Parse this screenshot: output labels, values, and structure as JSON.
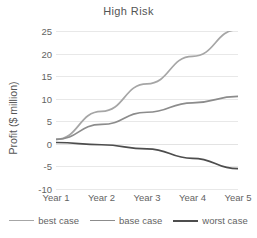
{
  "chart_data": {
    "type": "line",
    "title": "High Risk",
    "xlabel": "",
    "ylabel": "Profit ($ million)",
    "categories": [
      "Year 1",
      "Year 2",
      "Year 3",
      "Year 4",
      "Year 5"
    ],
    "ylim": [
      -10,
      25
    ],
    "yticks": [
      25,
      20,
      15,
      10,
      5,
      0,
      -5,
      -10
    ],
    "grid": true,
    "legend_position": "bottom",
    "series": [
      {
        "name": "best case",
        "color": "#a6a6a6",
        "values": [
          1.0,
          7.2,
          13.3,
          19.4,
          25.3
        ]
      },
      {
        "name": "base case",
        "color": "#8c8c8c",
        "values": [
          1.0,
          4.3,
          7.0,
          9.1,
          10.5
        ]
      },
      {
        "name": "worst case",
        "color": "#4d4d4d",
        "values": [
          0.3,
          -0.2,
          -1.1,
          -3.2,
          -5.5
        ]
      }
    ]
  },
  "legend": {
    "items": [
      {
        "label": "best case"
      },
      {
        "label": "base case"
      },
      {
        "label": "worst case"
      }
    ]
  },
  "colors": {
    "best_case": "#a6a6a6",
    "base_case": "#8c8c8c",
    "worst_case": "#4d4d4d",
    "gridline": "#e8e8e8",
    "text": "#636363",
    "background": "#ffffff"
  }
}
